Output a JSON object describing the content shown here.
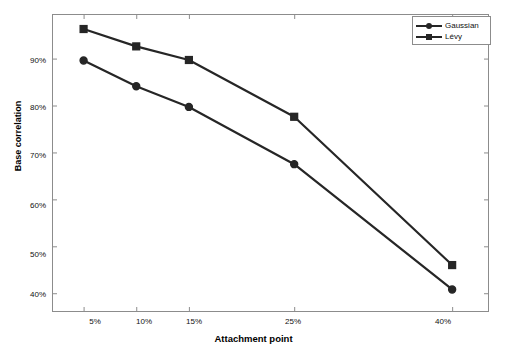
{
  "chart_data": {
    "type": "line",
    "title": "",
    "xlabel": "Attachment point",
    "ylabel": "Base correlation",
    "x": [
      5,
      10,
      15,
      25,
      40
    ],
    "categories": [
      "5%",
      "10%",
      "15%",
      "25%",
      "40%"
    ],
    "xtick_labels": [
      "5%",
      "10%",
      "15%",
      "25%",
      "40%"
    ],
    "ytick_labels": [
      "40%",
      "50%",
      "60%",
      "70%",
      "80%",
      "90%"
    ],
    "ytick_values": [
      40,
      50,
      60,
      70,
      80,
      90
    ],
    "xlim": [
      2.0,
      43.5
    ],
    "ylim": [
      36.0,
      99.5
    ],
    "grid": false,
    "legend_position": "top-right",
    "series": [
      {
        "name": "Gaussian",
        "marker": "circle",
        "color": "#262626",
        "values": [
          89.6,
          84.1,
          79.7,
          67.5,
          40.8
        ]
      },
      {
        "name": "Lévy",
        "marker": "square",
        "color": "#262626",
        "values": [
          96.3,
          92.6,
          89.7,
          77.6,
          46.0
        ]
      }
    ]
  },
  "axes": {
    "frame_color": "#8c8c8c",
    "tick_color": "#8c8c8c"
  },
  "legend": {
    "entries": [
      {
        "label": "Gaussian",
        "marker": "circle"
      },
      {
        "label": "Lévy",
        "marker": "square"
      }
    ]
  }
}
